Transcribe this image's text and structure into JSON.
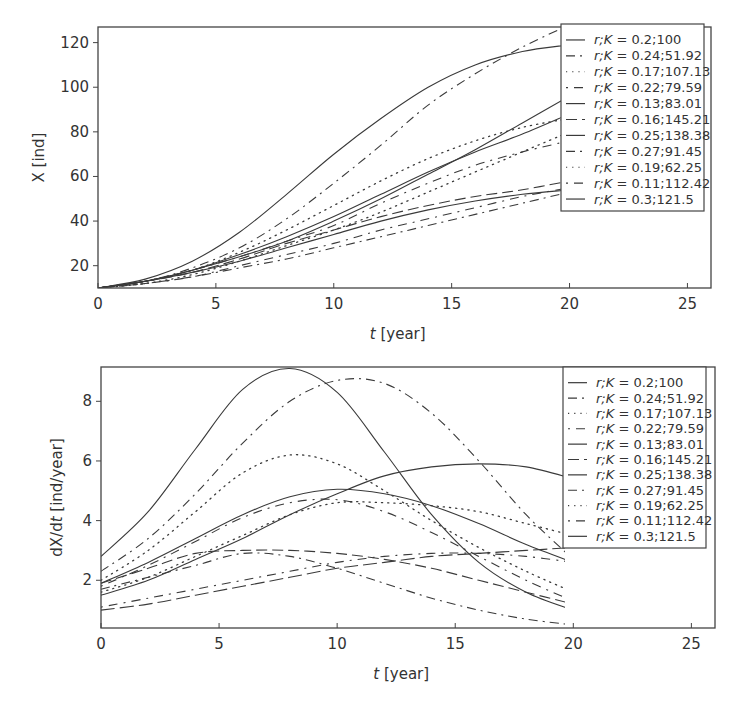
{
  "chart_data": [
    {
      "type": "line",
      "title": "",
      "xlabel": "t [year]",
      "ylabel": "X [ind]",
      "xlim": [
        0,
        26
      ],
      "ylim": [
        10,
        127
      ],
      "xticks": [
        0,
        5,
        10,
        15,
        20,
        25
      ],
      "yticks": [
        20,
        40,
        60,
        80,
        100,
        120
      ],
      "grid": false,
      "legend_position": "upper right",
      "x": [
        0,
        2,
        4,
        6,
        8,
        10,
        12,
        14,
        16,
        18,
        20
      ],
      "series": [
        {
          "name": "r;K = 0.2;100",
          "style": "solid",
          "values": [
            10,
            14,
            22,
            35,
            52,
            70,
            86,
            100,
            110,
            116,
            119
          ]
        },
        {
          "name": "r;K = 0.24;51.92",
          "style": "dash-dot",
          "values": [
            10,
            13,
            19,
            28,
            41,
            57,
            74,
            92,
            106,
            118,
            128
          ]
        },
        {
          "name": "r;K = 0.17;107.13",
          "style": "dotted",
          "values": [
            10,
            13,
            18,
            26,
            36,
            47,
            58,
            68,
            76,
            82,
            86
          ]
        },
        {
          "name": "r;K = 0.22;79.59",
          "style": "dot-dash",
          "values": [
            10,
            13,
            18,
            24,
            31,
            38,
            48,
            57,
            65,
            71,
            76
          ]
        },
        {
          "name": "r;K = 0.13;83.01",
          "style": "solid",
          "values": [
            10,
            13,
            18,
            24,
            31,
            40,
            50,
            61,
            72,
            84,
            96
          ]
        },
        {
          "name": "r;K = 0.16;145.21",
          "style": "dash-dash",
          "values": [
            10,
            13,
            17,
            23,
            30,
            36,
            42,
            47,
            51,
            54,
            58
          ]
        },
        {
          "name": "r;K = 0.25;138.38",
          "style": "solid",
          "values": [
            10,
            13,
            18,
            25,
            33,
            42,
            52,
            62,
            71,
            79,
            88
          ]
        },
        {
          "name": "r;K = 0.27;91.45",
          "style": "dash-dot",
          "values": [
            10,
            12,
            15,
            19,
            23,
            28,
            33,
            38,
            43,
            48,
            53
          ]
        },
        {
          "name": "r;K = 0.19;62.25",
          "style": "dotted",
          "values": [
            10,
            12,
            16,
            22,
            29,
            36,
            44,
            53,
            62,
            71,
            80
          ]
        },
        {
          "name": "r;K = 0.11;112.42",
          "style": "dot-dash",
          "values": [
            10,
            12,
            15,
            20,
            25,
            30,
            36,
            41,
            46,
            51,
            55
          ]
        },
        {
          "name": "r;K = 0.3;121.5",
          "style": "solid",
          "values": [
            10,
            13,
            17,
            22,
            28,
            34,
            40,
            45,
            49,
            52,
            54
          ]
        }
      ]
    },
    {
      "type": "line",
      "title": "",
      "xlabel": "t [year]",
      "ylabel": "dX/dt [ind/year]",
      "xlim": [
        0,
        26
      ],
      "ylim": [
        0.4,
        9.15
      ],
      "xticks": [
        0,
        5,
        10,
        15,
        20,
        25
      ],
      "yticks": [
        2,
        4,
        6,
        8
      ],
      "grid": false,
      "legend_position": "upper right",
      "x": [
        0,
        2,
        4,
        6,
        8,
        10,
        12,
        14,
        16,
        18,
        20
      ],
      "series": [
        {
          "name": "r;K = 0.2;100",
          "style": "solid",
          "values": [
            2.8,
            4.3,
            6.4,
            8.4,
            9.1,
            8.3,
            6.3,
            4.2,
            2.6,
            1.6,
            1.0
          ]
        },
        {
          "name": "r;K = 0.24;51.92",
          "style": "dash-dot",
          "values": [
            2.3,
            3.4,
            4.9,
            6.6,
            8.0,
            8.7,
            8.6,
            7.6,
            6.0,
            4.2,
            2.7
          ]
        },
        {
          "name": "r;K = 0.17;107.13",
          "style": "dotted",
          "values": [
            2.0,
            3.0,
            4.3,
            5.6,
            6.2,
            5.9,
            5.0,
            4.0,
            3.1,
            2.3,
            1.6
          ]
        },
        {
          "name": "r;K = 0.22;79.59",
          "style": "dot-dash",
          "values": [
            1.8,
            2.5,
            3.3,
            4.1,
            4.6,
            4.7,
            4.3,
            3.6,
            2.8,
            2.0,
            1.3
          ]
        },
        {
          "name": "r;K = 0.13;83.01",
          "style": "solid",
          "values": [
            1.9,
            2.6,
            3.4,
            4.2,
            4.8,
            5.05,
            4.9,
            4.5,
            3.9,
            3.2,
            2.6
          ]
        },
        {
          "name": "r;K = 0.16;145.21",
          "style": "dash-dash",
          "values": [
            1.9,
            2.4,
            2.9,
            3.0,
            3.0,
            2.9,
            2.7,
            2.4,
            2.0,
            1.6,
            1.2
          ]
        },
        {
          "name": "r;K = 0.25;138.38",
          "style": "solid",
          "values": [
            1.5,
            2.0,
            2.7,
            3.4,
            4.2,
            4.9,
            5.5,
            5.8,
            5.9,
            5.8,
            5.4
          ]
        },
        {
          "name": "r;K = 0.27;91.45",
          "style": "dash-dot",
          "values": [
            1.7,
            2.1,
            2.5,
            2.9,
            2.8,
            2.4,
            1.9,
            1.4,
            1.0,
            0.7,
            0.5
          ]
        },
        {
          "name": "r;K = 0.19;62.25",
          "style": "dotted",
          "values": [
            1.6,
            2.1,
            2.8,
            3.5,
            4.2,
            4.6,
            4.6,
            4.5,
            4.3,
            3.9,
            3.5
          ]
        },
        {
          "name": "r;K = 0.11;112.42",
          "style": "dot-dash",
          "values": [
            1.1,
            1.4,
            1.7,
            2.0,
            2.3,
            2.6,
            2.8,
            2.9,
            2.9,
            2.8,
            2.6
          ]
        },
        {
          "name": "r;K = 0.3;121.5",
          "style": "dash-long",
          "values": [
            1.0,
            1.2,
            1.5,
            1.8,
            2.1,
            2.4,
            2.6,
            2.8,
            2.9,
            3.0,
            3.1
          ]
        }
      ]
    }
  ],
  "charts": {
    "top": {
      "ylabel": "X [ind]",
      "xlabel_italic": "t",
      "xlabel_rest": " [year]",
      "xtick_labels": [
        "0",
        "5",
        "10",
        "15",
        "20",
        "25"
      ],
      "ytick_labels": [
        "20",
        "40",
        "60",
        "80",
        "100",
        "120"
      ]
    },
    "bottom": {
      "ylabel_prefix": "dX/d",
      "ylabel_italic": "t",
      "ylabel_rest": " [ind/year]",
      "xlabel_italic": "t",
      "xlabel_rest": " [year]",
      "xtick_labels": [
        "0",
        "5",
        "10",
        "15",
        "20",
        "25"
      ],
      "ytick_labels": [
        "2",
        "4",
        "6",
        "8"
      ]
    }
  },
  "legend": {
    "entries": [
      {
        "rk": "0.2;100",
        "style": "solid"
      },
      {
        "rk": "0.24;51.92",
        "style": "dash-dot"
      },
      {
        "rk": "0.17;107.13",
        "style": "dotted"
      },
      {
        "rk": "0.22;79.59",
        "style": "dot-dash"
      },
      {
        "rk": "0.13;83.01",
        "style": "solid"
      },
      {
        "rk": "0.16;145.21",
        "style": "dash-dash"
      },
      {
        "rk": "0.25;138.38",
        "style": "solid"
      },
      {
        "rk": "0.27;91.45",
        "style": "dash-dot"
      },
      {
        "rk": "0.19;62.25",
        "style": "dotted"
      },
      {
        "rk": "0.11;112.42",
        "style": "dot-dash"
      },
      {
        "rk": "0.3;121.5",
        "style": "solid"
      }
    ],
    "prefix_italic": "r;K",
    "equals": " = "
  },
  "colors": {
    "line": "#3a3a3a",
    "axis": "#444444",
    "text": "#333333",
    "background": "#ffffff"
  }
}
